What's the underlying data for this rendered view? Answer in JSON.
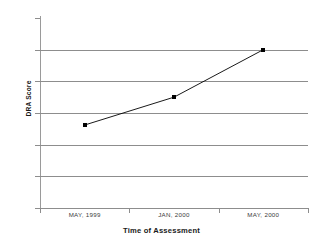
{
  "chart_data": {
    "type": "line",
    "title": "",
    "xlabel": "Time of Assessment",
    "ylabel": "DRA Score",
    "categories": [
      "MAY, 1999",
      "JAN, 2000",
      "MAY, 2000"
    ],
    "values": [
      13.1,
      17.5,
      25
    ],
    "series": [
      {
        "name": "DRA Score",
        "values": [
          13.1,
          17.5,
          25
        ]
      }
    ],
    "ylim": [
      0,
      30
    ],
    "yticks": [
      0,
      5,
      10,
      15,
      20,
      25,
      30
    ],
    "ytick_labels": [
      "0",
      "5",
      "10",
      "15",
      "20",
      "25",
      "30"
    ],
    "grid": "horizontal",
    "legend": "none",
    "marker": "square",
    "line_color": "#000000",
    "marker_color": "#000000",
    "grid_color": "#8d8d8d",
    "background": "#ffffff"
  },
  "axis": {
    "y_title": "DRA Score",
    "x_title": "Time of Assessment"
  }
}
